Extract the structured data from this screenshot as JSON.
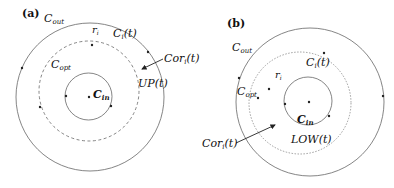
{
  "panels": [
    {
      "id": "a",
      "tag": "(a)",
      "labels": {
        "c_out": "C",
        "c_out_sub": "out",
        "r_i": "r",
        "r_i_sub": "i",
        "c_i": "C",
        "c_i_sub": "i",
        "c_i_arg": "(t)",
        "c_opt": "C",
        "c_opt_sub": "opt",
        "c_in": "C",
        "c_in_sub": "in",
        "cor": "Cor",
        "cor_sub": "i",
        "cor_arg": "(t)",
        "region": "UP(t)"
      },
      "circles": {
        "outer": {
          "cx": 90,
          "cy": 97,
          "r": 74,
          "style": "solid"
        },
        "optimal": {
          "cx": 89,
          "cy": 91,
          "r": 50,
          "style": "dashed"
        },
        "inner": {
          "cx": 88.5,
          "cy": 96.5,
          "r": 23.5,
          "style": "solid"
        }
      }
    },
    {
      "id": "b",
      "tag": "(b)",
      "labels": {
        "c_out": "C",
        "c_out_sub": "out",
        "r_i": "r",
        "r_i_sub": "i",
        "c_i": "C",
        "c_i_sub": "i",
        "c_i_arg": "(t)",
        "c_opt": "C",
        "c_opt_sub": "opt",
        "c_in": "C",
        "c_in_sub": "in",
        "cor": "Cor",
        "cor_sub": "i",
        "cor_arg": "(t)",
        "region": "LOW(t)"
      },
      "circles": {
        "outer": {
          "cx": 310,
          "cy": 102,
          "r": 74,
          "style": "solid"
        },
        "optimal": {
          "cx": 300,
          "cy": 103,
          "r": 51,
          "style": "dotted"
        },
        "inner": {
          "cx": 308,
          "cy": 101,
          "r": 24,
          "style": "solid"
        }
      }
    }
  ],
  "colors": {
    "stroke": "#555555",
    "dot": "#222222",
    "text": "#111111"
  }
}
